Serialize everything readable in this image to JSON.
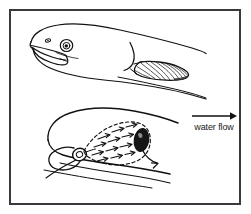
{
  "figure": {
    "border_color": "#3a3a3a",
    "ink_color": "#111111",
    "background_color": "#ffffff"
  },
  "annotations": {
    "water_flow_label": "water flow",
    "flow_arrow_icon": "right-arrow-icon",
    "flow_arrow_direction": "right"
  },
  "panels": {
    "upper": {
      "name": "fish-lateral-view",
      "description": "Lateral external view of fish head and forebody with open mouth, eye, nostril, opercular margin and hatched pectoral fin",
      "parts": {
        "eye": "eye",
        "nostril": "nostril",
        "mouth": "open-mouth",
        "operculum": "opercular-margin",
        "pectoral_fin": "hatched-pectoral-fin"
      }
    },
    "lower": {
      "name": "gill-chamber-flow-view",
      "description": "Cutaway view of the buccal and opercular chamber showing dashed chamber outline, interior flow arrows from mouth toward the opercular opening, and a curved arrow exiting the dark opercular slit",
      "parts": {
        "chamber_outline": "dashed-chamber-outline",
        "interior_arrows": "internal-flow-arrows",
        "opercular_opening": "dark-opercular-opening",
        "exit_arrow": "curved-exit-arrow",
        "mouth_ring": "mouth-opening"
      },
      "interior_arrow_count": 12
    }
  },
  "colors": {
    "ink": "#111111",
    "frame": "#3a3a3a",
    "fin_fill": "#2b2b2b",
    "opening_fill": "#151515",
    "paper": "#ffffff"
  }
}
